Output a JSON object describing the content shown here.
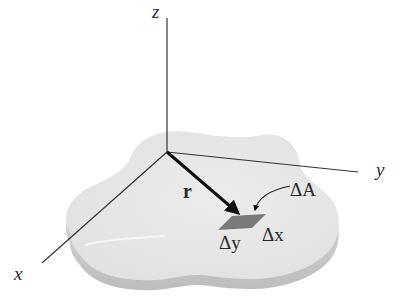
{
  "figure": {
    "axes": {
      "z_label": "z",
      "y_label": "y",
      "x_label": "x"
    },
    "vector": {
      "label": "r"
    },
    "element": {
      "area_label": "ΔA",
      "dx_label": "Δx",
      "dy_label": "Δy"
    },
    "colors": {
      "plate_top": "#e6e6e6",
      "plate_edge": "#c8c8c8",
      "axis_line": "#333333",
      "vector": "#111111",
      "element_fill": "#7a7a7a",
      "text": "#2a2a2a"
    }
  }
}
